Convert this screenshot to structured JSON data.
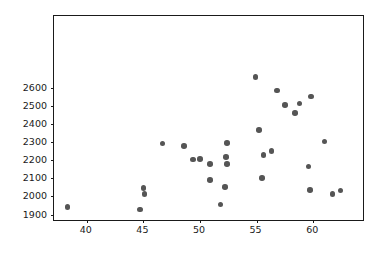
{
  "chart_data": {
    "type": "scatter",
    "title": "",
    "xlabel": "",
    "ylabel": "",
    "grid": false,
    "legend": null,
    "xlim": [
      37.1,
      64.4
    ],
    "ylim": [
      1870,
      2995
    ],
    "xticks": [
      40,
      45,
      50,
      55,
      60
    ],
    "yticks": [
      1900,
      2000,
      2100,
      2200,
      2300,
      2400,
      2500,
      2600
    ],
    "xtick_labels": [
      "40",
      "45",
      "50",
      "55",
      "60"
    ],
    "ytick_labels": [
      "1900",
      "2000",
      "2100",
      "2200",
      "2300",
      "2400",
      "2500",
      "2600"
    ],
    "marker": {
      "shape": "circle",
      "color": "#555555",
      "size": 5.6
    },
    "series": [
      {
        "name": "points",
        "points": [
          {
            "x": 38.3,
            "y": 1941
          },
          {
            "x": 44.7,
            "y": 1928
          },
          {
            "x": 45.0,
            "y": 2047
          },
          {
            "x": 45.1,
            "y": 2014
          },
          {
            "x": 46.7,
            "y": 2292
          },
          {
            "x": 48.6,
            "y": 2278
          },
          {
            "x": 49.4,
            "y": 2203
          },
          {
            "x": 50.0,
            "y": 2207
          },
          {
            "x": 50.9,
            "y": 2089
          },
          {
            "x": 50.9,
            "y": 2178
          },
          {
            "x": 51.8,
            "y": 1956
          },
          {
            "x": 52.2,
            "y": 2052
          },
          {
            "x": 52.3,
            "y": 2219
          },
          {
            "x": 52.4,
            "y": 2178
          },
          {
            "x": 52.4,
            "y": 2293
          },
          {
            "x": 54.9,
            "y": 2658
          },
          {
            "x": 55.2,
            "y": 2367
          },
          {
            "x": 55.5,
            "y": 2103
          },
          {
            "x": 55.6,
            "y": 2230
          },
          {
            "x": 56.3,
            "y": 2252
          },
          {
            "x": 56.8,
            "y": 2585
          },
          {
            "x": 57.5,
            "y": 2504
          },
          {
            "x": 58.4,
            "y": 2459
          },
          {
            "x": 58.8,
            "y": 2512
          },
          {
            "x": 59.6,
            "y": 2164
          },
          {
            "x": 59.7,
            "y": 2037
          },
          {
            "x": 59.8,
            "y": 2552
          },
          {
            "x": 61.0,
            "y": 2304
          },
          {
            "x": 61.7,
            "y": 2012
          },
          {
            "x": 62.4,
            "y": 2033
          }
        ]
      }
    ]
  }
}
